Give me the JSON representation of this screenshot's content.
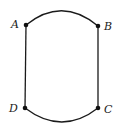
{
  "diagram": {
    "type": "graph",
    "vertices": [
      {
        "id": "A",
        "label": "A",
        "x": 26,
        "y": 25
      },
      {
        "id": "B",
        "label": "B",
        "x": 98,
        "y": 26
      },
      {
        "id": "C",
        "label": "C",
        "x": 98,
        "y": 108
      },
      {
        "id": "D",
        "label": "D",
        "x": 25,
        "y": 108
      }
    ],
    "edges": [
      {
        "from": "A",
        "to": "B",
        "shape": "arc-up"
      },
      {
        "from": "B",
        "to": "C",
        "shape": "straight"
      },
      {
        "from": "C",
        "to": "D",
        "shape": "arc-down"
      },
      {
        "from": "D",
        "to": "A",
        "shape": "straight"
      }
    ],
    "colors": {
      "stroke": "#1a1a1a",
      "vertex": "#111111",
      "background": "#ffffff"
    }
  }
}
